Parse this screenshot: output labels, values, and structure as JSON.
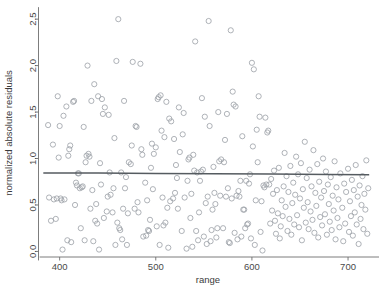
{
  "chart_data": {
    "type": "scatter",
    "title": "",
    "xlabel": "range",
    "ylabel": "normalized absolute residuals",
    "xlim": [
      378,
      727
    ],
    "ylim": [
      -0.06,
      2.62
    ],
    "xticks": [
      400,
      500,
      600,
      700
    ],
    "xtick_labels": [
      "400",
      "500",
      "600",
      "700"
    ],
    "yticks": [
      0.0,
      0.5,
      1.0,
      1.5,
      2.0,
      2.5
    ],
    "ytick_labels": [
      "0.0",
      "0.5",
      "1.0",
      "1.5",
      "2.0",
      "2.5"
    ],
    "grid": false,
    "legend": false,
    "marker": "open-circle",
    "marker_color": "#9aa0a6",
    "marker_size": 2.6,
    "series": [
      {
        "name": "normalized absolute residuals vs range",
        "x": [
          388,
          389,
          391,
          393,
          394,
          396,
          397,
          398,
          399,
          400,
          401,
          402,
          403,
          404,
          405,
          407,
          408,
          409,
          410,
          411,
          412,
          414,
          415,
          416,
          417,
          418,
          419,
          420,
          421,
          422,
          423,
          424,
          425,
          426,
          427,
          428,
          429,
          430,
          431,
          432,
          433,
          434,
          435,
          436,
          437,
          438,
          439,
          440,
          441,
          442,
          443,
          444,
          445,
          446,
          447,
          449,
          450,
          451,
          452,
          453,
          455,
          456,
          457,
          458,
          459,
          460,
          461,
          462,
          463,
          464,
          465,
          466,
          467,
          468,
          469,
          470,
          471,
          472,
          474,
          475,
          476,
          478,
          479,
          480,
          481,
          482,
          484,
          485,
          486,
          487,
          489,
          490,
          491,
          492,
          493,
          494,
          495,
          496,
          497,
          498,
          500,
          501,
          502,
          503,
          504,
          505,
          506,
          507,
          508,
          509,
          510,
          511,
          512,
          513,
          514,
          515,
          516,
          518,
          519,
          520,
          521,
          522,
          523,
          524,
          525,
          527,
          528,
          529,
          530,
          532,
          533,
          534,
          535,
          536,
          537,
          538,
          539,
          540,
          541,
          542,
          543,
          544,
          545,
          546,
          547,
          548,
          549,
          550,
          551,
          552,
          553,
          554,
          555,
          556,
          557,
          558,
          559,
          560,
          561,
          562,
          563,
          564,
          565,
          566,
          567,
          568,
          570,
          571,
          572,
          573,
          574,
          575,
          576,
          577,
          578,
          579,
          580,
          581,
          582,
          583,
          584,
          585,
          586,
          587,
          588,
          589,
          590,
          591,
          592,
          593,
          594,
          595,
          596,
          597,
          598,
          599,
          600,
          601,
          602,
          603,
          604,
          605,
          606,
          607,
          608,
          609,
          610,
          611,
          612,
          613,
          614,
          615,
          616,
          617,
          618,
          619,
          620,
          621,
          622,
          623,
          624,
          625,
          626,
          627,
          628,
          629,
          630,
          631,
          632,
          633,
          634,
          635,
          636,
          637,
          638,
          639,
          640,
          641,
          642,
          643,
          644,
          645,
          646,
          647,
          648,
          649,
          650,
          651,
          652,
          653,
          654,
          655,
          656,
          657,
          658,
          659,
          660,
          661,
          662,
          663,
          664,
          665,
          666,
          667,
          668,
          669,
          670,
          671,
          672,
          673,
          674,
          675,
          676,
          677,
          678,
          679,
          680,
          681,
          682,
          683,
          684,
          685,
          686,
          687,
          688,
          689,
          690,
          691,
          692,
          694,
          695,
          696,
          697,
          698,
          700,
          701,
          702,
          703,
          704,
          705,
          706,
          707,
          708,
          709,
          710,
          711,
          712,
          713,
          714,
          715,
          716,
          717,
          718,
          719,
          720,
          721
        ],
        "y": [
          1.36,
          0.58,
          0.33,
          1.15,
          0.56,
          0.35,
          0.57,
          1.67,
          1.01,
          1.35,
          0.57,
          0.55,
          0.02,
          1.46,
          0.56,
          1.56,
          0.12,
          1.03,
          1.1,
          1.14,
          0.1,
          1.61,
          1.62,
          0.5,
          0.74,
          0.71,
          0.84,
          0.84,
          0.68,
          0.25,
          0.69,
          0.7,
          1.34,
          0.12,
          0.96,
          1.03,
          2.0,
          1.05,
          1.02,
          0.46,
          1.62,
          0.66,
          0.11,
          1.8,
          0.33,
          0.51,
          0.3,
          1.67,
          0.02,
          0.95,
          0.72,
          1.64,
          1.48,
          0.36,
          1.55,
          0.43,
          0.59,
          1.47,
          0.85,
          0.61,
          0.42,
          0.68,
          1.22,
          0.07,
          2.05,
          0.31,
          2.5,
          0.25,
          0.23,
          0.85,
          0.13,
          0.46,
          1.62,
          0.68,
          0.8,
          0.07,
          0.41,
          0.96,
          0.94,
          1.14,
          2.04,
          0.46,
          1.35,
          1.34,
          0.53,
          0.42,
          2.02,
          1.1,
          1.04,
          0.16,
          0.74,
          0.17,
          0.55,
          0.23,
          0.22,
          0.34,
          0.9,
          1.16,
          0.67,
          1.05,
          1.12,
          0.27,
          1.64,
          1.66,
          0.07,
          1.68,
          1.3,
          0.58,
          0.28,
          1.23,
          0.31,
          1.61,
          0.47,
          0.04,
          1.43,
          0.54,
          1.4,
          0.57,
          1.21,
          0.63,
          0.93,
          0.79,
          0.46,
          1.55,
          1.07,
          0.22,
          1.26,
          1.49,
          0.58,
          0.03,
          0.76,
          0.99,
          1.01,
          0.36,
          0.62,
          0.05,
          1.04,
          0.87,
          2.26,
          0.22,
          0.85,
          0.12,
          0.42,
          0.76,
          0.86,
          1.65,
          0.88,
          0.16,
          1.45,
          0.52,
          0.08,
          0.59,
          2.48,
          1.35,
          0.11,
          0.23,
          0.45,
          0.91,
          0.63,
          0.51,
          0.15,
          0.25,
          1.5,
          0.97,
          0.6,
          0.99,
          0.25,
          0.96,
          1.2,
          0.59,
          1.48,
          0.68,
          0.1,
          0.09,
          2.38,
          0.57,
          1.72,
          1.58,
          0.2,
          1.56,
          0.6,
          0.13,
          0.65,
          0.59,
          0.76,
          0.16,
          1.24,
          0.45,
          0.45,
          0.25,
          0.76,
          0.29,
          0.3,
          0.73,
          0.83,
          0.14,
          2.03,
          1.13,
          1.96,
          0.07,
          0.55,
          1.31,
          0.96,
          1.67,
          1.45,
          0.21,
          0.54,
          0.01,
          0.71,
          0.69,
          1.44,
          0.72,
          1.28,
          1.3,
          0.72,
          0.3,
          0.78,
          0.44,
          0.62,
          0.87,
          0.33,
          0.19,
          0.66,
          0.41,
          0.9,
          0.14,
          0.27,
          0.55,
          0.38,
          0.7,
          1.06,
          0.48,
          0.81,
          0.22,
          0.64,
          0.35,
          0.92,
          0.18,
          0.52,
          0.74,
          0.29,
          0.61,
          1.02,
          0.39,
          0.83,
          0.26,
          0.57,
          0.95,
          0.12,
          0.67,
          0.47,
          1.18,
          0.31,
          0.79,
          0.53,
          0.24,
          0.88,
          0.43,
          0.7,
          0.34,
          1.09,
          0.2,
          0.63,
          0.49,
          0.94,
          0.15,
          0.75,
          0.37,
          0.58,
          0.28,
          1.0,
          0.65,
          0.4,
          0.86,
          0.18,
          0.72,
          0.51,
          0.32,
          0.8,
          0.23,
          0.6,
          0.44,
          0.97,
          0.13,
          0.69,
          0.36,
          0.56,
          0.26,
          0.84,
          0.47,
          0.11,
          0.73,
          0.3,
          0.64,
          0.89,
          0.21,
          0.54,
          0.38,
          0.77,
          0.17,
          0.66,
          0.42,
          0.93,
          0.29,
          0.59,
          0.08,
          0.71,
          0.35,
          0.5,
          0.81,
          0.24,
          0.62,
          0.45,
          0.98,
          0.19,
          0.68
        ]
      }
    ],
    "fit_line": {
      "name": "lowess-fit",
      "color": "#555b60",
      "x": [
        383,
        440,
        500,
        560,
        620,
        680,
        722
      ],
      "y": [
        0.845,
        0.843,
        0.84,
        0.836,
        0.832,
        0.827,
        0.824
      ]
    }
  },
  "axes": {
    "x_title": "range",
    "y_title": "normalized absolute residuals"
  }
}
